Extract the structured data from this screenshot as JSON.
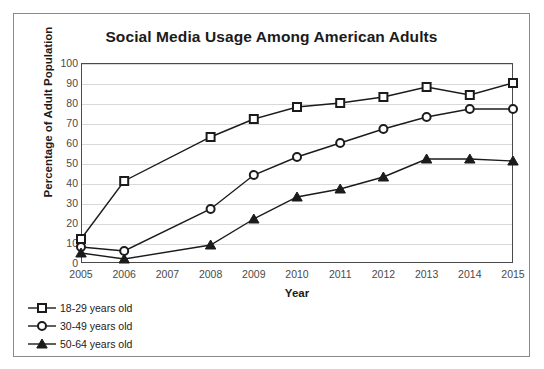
{
  "chart_data": {
    "type": "line",
    "title": "Social Media Usage Among American Adults",
    "xlabel": "Year",
    "ylabel": "Percentage of Adult Population",
    "x": [
      2005,
      2006,
      2007,
      2008,
      2009,
      2010,
      2011,
      2012,
      2013,
      2014,
      2015
    ],
    "categories": [
      "2005",
      "2006",
      "2007",
      "2008",
      "2009",
      "2010",
      "2011",
      "2012",
      "2013",
      "2014",
      "2015"
    ],
    "xlim": [
      2005,
      2015
    ],
    "ylim": [
      0,
      100
    ],
    "yticks": [
      0,
      10,
      20,
      30,
      40,
      50,
      60,
      70,
      80,
      90,
      100
    ],
    "grid": true,
    "legend_position": "below-left",
    "series": [
      {
        "name": "18-29 years old",
        "marker": "square-open",
        "color": "#1b1b1b",
        "x": [
          2005,
          2006,
          2008,
          2009,
          2010,
          2011,
          2012,
          2013,
          2014,
          2015
        ],
        "values": [
          12,
          41,
          63,
          72,
          78,
          80,
          83,
          88,
          84,
          90
        ]
      },
      {
        "name": "30-49 years old",
        "marker": "circle-open",
        "color": "#1b1b1b",
        "x": [
          2005,
          2006,
          2008,
          2009,
          2010,
          2011,
          2012,
          2013,
          2014,
          2015
        ],
        "values": [
          8,
          6,
          27,
          44,
          53,
          60,
          67,
          73,
          77,
          77
        ]
      },
      {
        "name": "50-64 years old",
        "marker": "triangle-filled",
        "color": "#1b1b1b",
        "x": [
          2005,
          2006,
          2008,
          2009,
          2010,
          2011,
          2012,
          2013,
          2014,
          2015
        ],
        "values": [
          5,
          2,
          9,
          22,
          33,
          37,
          43,
          52,
          52,
          51
        ]
      }
    ]
  },
  "legend": {
    "items": [
      {
        "label": "18-29 years old",
        "marker": "square-open"
      },
      {
        "label": "30-49 years old",
        "marker": "circle-open"
      },
      {
        "label": "50-64 years old",
        "marker": "triangle-filled"
      }
    ]
  }
}
